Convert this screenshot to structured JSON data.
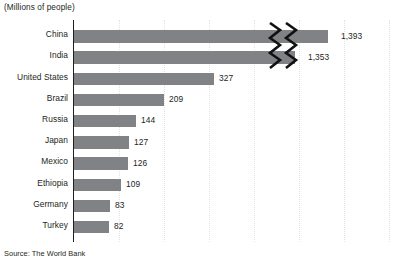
{
  "subtitle": "(Millions of people)",
  "source": "Source: The World Bank",
  "colors": {
    "bar": "#808285",
    "axis": "#231f20",
    "grid": "#e3e1e2",
    "text": "#231f20"
  },
  "chart_data": {
    "type": "bar",
    "orientation": "horizontal",
    "title": "",
    "subtitle": "(Millions of people)",
    "xlabel": "",
    "ylabel": "",
    "grid": true,
    "legend": false,
    "axis_break": {
      "present": true,
      "style": "double-zigzag",
      "applies_to": [
        "China",
        "India"
      ],
      "note": "Scale break on the two longest bars"
    },
    "xlim": [
      0,
      400
    ],
    "xticks": [
      100,
      200,
      300,
      400
    ],
    "categories": [
      "China",
      "India",
      "United States",
      "Brazil",
      "Russia",
      "Japan",
      "Mexico",
      "Ethiopia",
      "Germany",
      "Turkey"
    ],
    "values": [
      1393,
      1353,
      327,
      209,
      144,
      127,
      126,
      109,
      83,
      82
    ],
    "value_labels": [
      "1,393",
      "1,353",
      "327",
      "209",
      "144",
      "127",
      "126",
      "109",
      "83",
      "82"
    ]
  },
  "bars": [
    {
      "label": "China",
      "value_label": "1,393",
      "bar_width": 254,
      "label_x": 341,
      "broken": true
    },
    {
      "label": "India",
      "value_label": "1,353",
      "bar_width": 221,
      "label_x": 308,
      "broken": true
    },
    {
      "label": "United States",
      "value_label": "327",
      "bar_width": 140,
      "label_x": 219,
      "broken": false
    },
    {
      "label": "Brazil",
      "value_label": "209",
      "bar_width": 90,
      "label_x": 169,
      "broken": false
    },
    {
      "label": "Russia",
      "value_label": "144",
      "bar_width": 62,
      "label_x": 141,
      "broken": false
    },
    {
      "label": "Japan",
      "value_label": "127",
      "bar_width": 55,
      "label_x": 134,
      "broken": false
    },
    {
      "label": "Mexico",
      "value_label": "126",
      "bar_width": 54,
      "label_x": 133,
      "broken": false
    },
    {
      "label": "Ethiopia",
      "value_label": "109",
      "bar_width": 47,
      "label_x": 126,
      "broken": false
    },
    {
      "label": "Germany",
      "value_label": "83",
      "bar_width": 36,
      "label_x": 115,
      "broken": false
    },
    {
      "label": "Turkey",
      "value_label": "82",
      "bar_width": 35,
      "label_x": 114,
      "broken": false
    }
  ],
  "gridlines_x": [
    119,
    164,
    209,
    254,
    299,
    344,
    389
  ]
}
